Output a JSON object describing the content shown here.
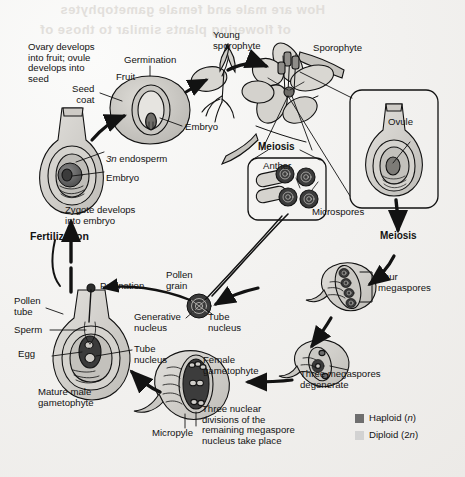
{
  "diagram": {
    "background_color": "#f4f3f1"
  },
  "bleed_text": {
    "line1": "How are male and female gametophytes",
    "line2": "of flowering plants similar to those of"
  },
  "labels": {
    "ovary_develops": "Ovary develops\ninto fruit; ovule\ndevelops into\nseed",
    "germination": "Germination",
    "fruit": "Fruit",
    "seed_coat": "Seed\ncoat",
    "embryo_fruit": "Embryo",
    "young_sporophyte": "Young\nsporophyte",
    "sporophyte": "Sporophyte",
    "ovule": "Ovule",
    "meiosis_anther": "Meiosis",
    "anther": "Anther",
    "microspores": "Microspores",
    "meiosis_ovule": "Meiosis",
    "endosperm": "3n endosperm",
    "embryo_seed": "Embryo",
    "zygote_develops": "Zygote develops\ninto embryo",
    "fertilization": "Fertilization",
    "pollination": "Pollination",
    "pollen_grain": "Pollen\ngrain",
    "generative_nucleus": "Generative\nnucleus",
    "tube_nucleus_grain": "Tube\nnucleus",
    "pollen_tube": "Pollen\ntube",
    "sperm": "Sperm",
    "egg": "Egg",
    "tube_nucleus_gam": "Tube\nnucleus",
    "mature_male_gametophyte": "Mature male\ngametophyte",
    "micropyle": "Micropyle",
    "female_gametophyte": "Female\ngametophyte",
    "three_nuclear": "Three nuclear\ndivisions of the\nremaining megaspore\nnucleus take place",
    "three_megaspores": "Three megaspores\ndegenerate",
    "four_megaspores": "Four\nmegaspores"
  },
  "legend": {
    "haploid": "Haploid (n)",
    "haploid_text": "Haploid (",
    "haploid_italic": "n",
    "haploid_close": ")",
    "diploid_text": "Diploid (2",
    "diploid_italic": "n",
    "diploid_close": ")",
    "haploid_color": "#6e6e6e",
    "diploid_color": "#d2d2d2"
  },
  "colors": {
    "ink": "#131313",
    "haploid_fill": "#6e6e6e",
    "diploid_fill": "#cfcdc9",
    "mid_fill": "#b4b2ae",
    "paper": "#f4f3f1"
  }
}
